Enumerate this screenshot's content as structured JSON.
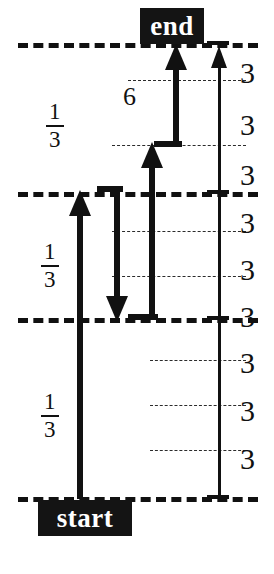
{
  "figure": {
    "type": "diagram",
    "title": "",
    "background_color": "#ffffff",
    "ink_color": "#111111"
  },
  "tags": [
    {
      "name": "end-tag",
      "label": "end",
      "x": 140,
      "y": 8,
      "width": 64,
      "height": 36,
      "font_size": 27
    },
    {
      "name": "start-tag",
      "label": "start",
      "x": 38,
      "y": 500,
      "width": 94,
      "height": 36,
      "font_size": 27
    }
  ],
  "major_levels": [
    {
      "name": "level-end",
      "y": 43,
      "x": 18,
      "width": 240
    },
    {
      "name": "level-third-2",
      "y": 192,
      "x": 18,
      "width": 240
    },
    {
      "name": "level-third-1",
      "y": 318,
      "x": 18,
      "width": 240
    },
    {
      "name": "level-start",
      "y": 497,
      "x": 18,
      "width": 240
    }
  ],
  "minor_levels": [
    {
      "name": "minor-1",
      "y": 80,
      "x": 128,
      "width": 118
    },
    {
      "name": "minor-2",
      "y": 145,
      "x": 112,
      "width": 134
    },
    {
      "name": "minor-3",
      "y": 231,
      "x": 112,
      "width": 134
    },
    {
      "name": "minor-4",
      "y": 276,
      "x": 112,
      "width": 134
    },
    {
      "name": "minor-5",
      "y": 360,
      "x": 150,
      "width": 96
    },
    {
      "name": "minor-6",
      "y": 405,
      "x": 150,
      "width": 96
    },
    {
      "name": "minor-7",
      "y": 450,
      "x": 150,
      "width": 96
    }
  ],
  "fraction_labels": [
    {
      "name": "fraction-top",
      "numerator": "1",
      "denominator": "3",
      "x": 46,
      "y": 100
    },
    {
      "name": "fraction-middle",
      "numerator": "1",
      "denominator": "3",
      "x": 41,
      "y": 240
    },
    {
      "name": "fraction-bottom",
      "numerator": "1",
      "denominator": "3",
      "x": 41,
      "y": 390
    }
  ],
  "step_label": {
    "name": "six-label",
    "text": "6",
    "x": 123,
    "y": 84
  },
  "ruler": {
    "name": "right-ruler",
    "axis_x": 219,
    "axis_top": 47,
    "axis_bottom": 497,
    "arrow": "up",
    "tick_values": [
      "3",
      "3",
      "3",
      "3",
      "3",
      "3",
      "3",
      "3",
      "3"
    ],
    "tick_label_x": 240,
    "tick_label_ys": [
      58,
      110,
      160,
      208,
      255,
      302,
      348,
      396,
      444
    ],
    "segment_count": 9,
    "segment_value": 3
  },
  "arrows": [
    {
      "name": "arrow-start-to-mid",
      "direction": "up",
      "x": 80,
      "from_y": 497,
      "to_y": 192,
      "style": "thick"
    },
    {
      "name": "arrow-mid-down",
      "direction": "down",
      "x": 116,
      "from_y": 192,
      "to_y": 318,
      "style": "thick"
    },
    {
      "name": "arrow-mid-to-minor",
      "direction": "up",
      "x": 152,
      "from_y": 318,
      "to_y": 145,
      "style": "thick"
    },
    {
      "name": "arrow-minor-to-end",
      "direction": "up",
      "x": 176,
      "from_y": 145,
      "to_y": 43,
      "style": "thick"
    }
  ],
  "connectors": [
    {
      "name": "connector-top-mid",
      "x": 97,
      "y": 189,
      "width": 26
    },
    {
      "name": "connector-bottom-mid",
      "x": 128,
      "y": 315,
      "width": 30
    },
    {
      "name": "connector-upper-step",
      "x": 154,
      "y": 142,
      "width": 28
    }
  ]
}
